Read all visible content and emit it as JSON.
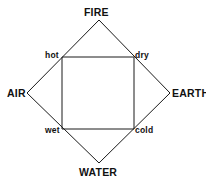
{
  "diagram": {
    "background_color": "#ffffff",
    "line_color": "#1a1a1a",
    "text_color": "#111111",
    "elements": [
      {
        "id": "fire",
        "label": "FIRE",
        "position": "top",
        "vertex": {
          "x": 99,
          "y": 20
        }
      },
      {
        "id": "air",
        "label": "AIR",
        "position": "left",
        "vertex": {
          "x": 27,
          "y": 93
        }
      },
      {
        "id": "earth",
        "label": "EARTH",
        "position": "right",
        "vertex": {
          "x": 170,
          "y": 93
        }
      },
      {
        "id": "water",
        "label": "WATER",
        "position": "bottom",
        "vertex": {
          "x": 99,
          "y": 163
        }
      }
    ],
    "qualities": [
      {
        "id": "hot",
        "label": "hot",
        "position": "top-left",
        "vertex": {
          "x": 62,
          "y": 57
        }
      },
      {
        "id": "dry",
        "label": "dry",
        "position": "top-right",
        "vertex": {
          "x": 134,
          "y": 57
        }
      },
      {
        "id": "wet",
        "label": "wet",
        "position": "bottom-left",
        "vertex": {
          "x": 62,
          "y": 129
        }
      },
      {
        "id": "cold",
        "label": "cold",
        "position": "bottom-right",
        "vertex": {
          "x": 134,
          "y": 129
        }
      }
    ],
    "shapes": {
      "diamond_points": "99,20 170,93 99,163 27,93",
      "square_points": "62,57 134,57 134,129 62,129"
    }
  }
}
